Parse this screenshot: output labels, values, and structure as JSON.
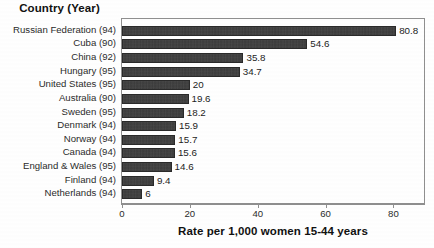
{
  "chart_data": {
    "type": "bar",
    "orientation": "horizontal",
    "title": "",
    "ylabel": "Country (Year)",
    "xlabel": "Rate per 1,000 women 15-44 years",
    "xlim": [
      0,
      89
    ],
    "xticks": [
      0,
      20,
      40,
      60,
      80
    ],
    "xtick_labels": [
      "0",
      "20",
      "40",
      "60",
      "80"
    ],
    "grid": false,
    "legend": null,
    "categories": [
      "Russian Federation (94)",
      "Cuba (90)",
      "China (92)",
      "Hungary (95)",
      "United States (95)",
      "Australia (90)",
      "Sweden (95)",
      "Denmark (94)",
      "Norway (94)",
      "Canada (94)",
      "England & Wales (95)",
      "Finland (94)",
      "Netherlands (94)"
    ],
    "values": [
      80.8,
      54.6,
      35.8,
      34.7,
      20,
      19.6,
      18.2,
      15.9,
      15.7,
      15.6,
      14.6,
      9.4,
      6
    ],
    "value_labels": [
      "80.8",
      "54.6",
      "35.8",
      "34.7",
      "20",
      "19.6",
      "18.2",
      "15.9",
      "15.7",
      "15.6",
      "14.6",
      "9.4",
      "6"
    ],
    "bar_color": "#3c3c3c",
    "frame_color": "#8f8f8f",
    "background": "#ffffff"
  },
  "axes": {
    "y_header": "Country (Year)",
    "x_title": "Rate per 1,000 women 15-44 years"
  }
}
